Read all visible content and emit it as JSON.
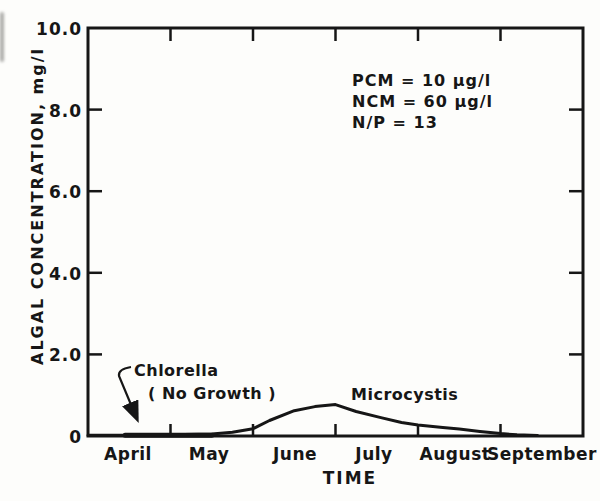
{
  "figure": {
    "background": "#fdfdfb",
    "ink": "#161616"
  },
  "chart_data": {
    "type": "line",
    "title": "",
    "xlabel": "TIME",
    "ylabel": "ALGAL CONCENTRATION, mg/l",
    "x_categories": [
      "April",
      "May",
      "June",
      "July",
      "August",
      "September"
    ],
    "xlim_months": [
      0,
      6
    ],
    "ylim": [
      0,
      10
    ],
    "grid": false,
    "yticks": [
      {
        "value": 10,
        "label": "10.0"
      },
      {
        "value": 8,
        "label": "8.0"
      },
      {
        "value": 6,
        "label": "6.0"
      },
      {
        "value": 4,
        "label": "4.0"
      },
      {
        "value": 2,
        "label": "2.0"
      },
      {
        "value": 0,
        "label": "0"
      }
    ],
    "annotations": [
      "PCM = 10 µg/l",
      "NCM = 60 µg/l",
      "N/P = 13"
    ],
    "series": [
      {
        "name": "Chlorella",
        "label_line1": "Chlorella",
        "label_line2": "( No Growth )",
        "note": "no growth - flat at zero, arrow callout",
        "x": [
          0.45,
          1.5
        ],
        "y": [
          0.02,
          0.02
        ]
      },
      {
        "name": "Microcystis",
        "x": [
          0,
          0.5,
          1.0,
          1.5,
          1.75,
          2.0,
          2.2,
          2.5,
          2.75,
          3.0,
          3.25,
          3.55,
          3.8,
          4.0,
          4.3,
          4.5,
          4.75,
          5.0,
          5.2,
          5.45
        ],
        "y": [
          0.02,
          0.02,
          0.03,
          0.05,
          0.09,
          0.18,
          0.38,
          0.62,
          0.72,
          0.77,
          0.6,
          0.45,
          0.33,
          0.27,
          0.21,
          0.17,
          0.11,
          0.06,
          0.03,
          0.01
        ]
      }
    ]
  }
}
